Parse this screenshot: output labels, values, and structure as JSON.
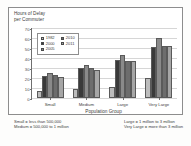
{
  "chart_data": {
    "type": "bar",
    "title": "Hours of Delay\nper Commuter",
    "xlabel": "Population Group",
    "ylabel": "",
    "categories": [
      "Small",
      "Medium",
      "Large",
      "Very Large"
    ],
    "series": [
      {
        "name": "1982",
        "color": "#bcbcbc",
        "values": [
          7,
          9,
          11,
          20
        ]
      },
      {
        "name": "2000",
        "color": "#3a3a3a",
        "values": [
          22,
          30,
          38,
          51
        ]
      },
      {
        "name": "2005",
        "color": "#8a8a8a",
        "values": [
          25,
          33,
          43,
          60
        ]
      },
      {
        "name": "2010",
        "color": "#6d6d6d",
        "values": [
          23,
          30,
          37,
          52
        ]
      },
      {
        "name": "2011",
        "color": "#a6a6a6",
        "values": [
          21,
          28,
          37,
          52
        ]
      }
    ],
    "yticks": [
      0,
      10,
      20,
      30,
      40,
      50,
      60,
      70
    ],
    "ylim": [
      0,
      70
    ],
    "grid": true,
    "legend_position": "upper-left-inside"
  },
  "notes": {
    "left": [
      "Small = less than 500,000",
      "Medium = 500,000 to 1 million"
    ],
    "right": [
      "Large = 1 million to 3 million",
      "Very Large = more than 3 million"
    ]
  }
}
